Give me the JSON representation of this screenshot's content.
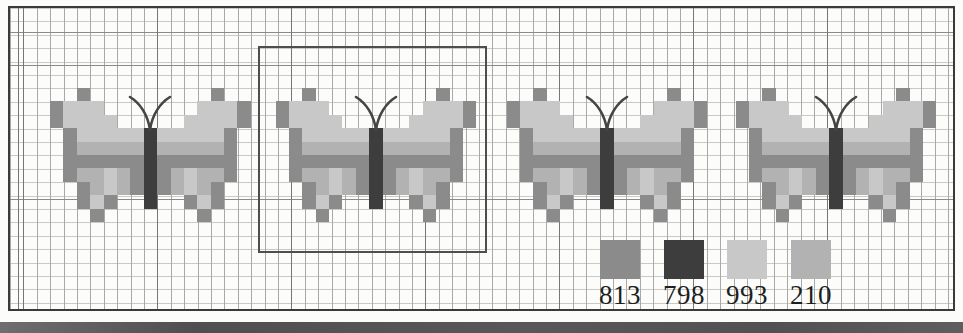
{
  "legend": {
    "items": [
      {
        "code": "813",
        "hex": "#8b8b8b"
      },
      {
        "code": "798",
        "hex": "#3d3d3d"
      },
      {
        "code": "993",
        "hex": "#c8c8c8"
      },
      {
        "code": "210",
        "hex": "#b2b2b2"
      }
    ]
  },
  "pattern": {
    "grid_columns": 15,
    "grid_rows": 10,
    "palette": {
      "M": {
        "code": "813",
        "hex": "#8b8b8b"
      },
      "D": {
        "code": "798",
        "hex": "#3d3d3d"
      },
      "L": {
        "code": "993",
        "hex": "#c8c8c8"
      },
      "T": {
        "code": "210",
        "hex": "#b2b2b2"
      },
      ".": {
        "code": "empty",
        "hex": ""
      }
    },
    "rows": [
      "..M.........M..",
      "MLLL.......LLLM",
      "MLLLL.....LLLLM",
      ".MLLLLLDLLLLLM.",
      ".MTTTTTDTTTTTM.",
      ".MMMMMMDMMMMMM.",
      ".MTTLTMDMTLTTM.",
      "..MTLTMDMTLTM..",
      "..MLM..D..MLM..",
      "...M.......M..."
    ]
  },
  "butterflies": [
    {
      "framed": false
    },
    {
      "framed": true
    },
    {
      "framed": false
    },
    {
      "framed": false
    }
  ],
  "colors": {
    "antennae": "#454545",
    "frame": "#4e4e4e",
    "outer_border": "#3a3a3a",
    "bottom_bar": "#555555"
  }
}
